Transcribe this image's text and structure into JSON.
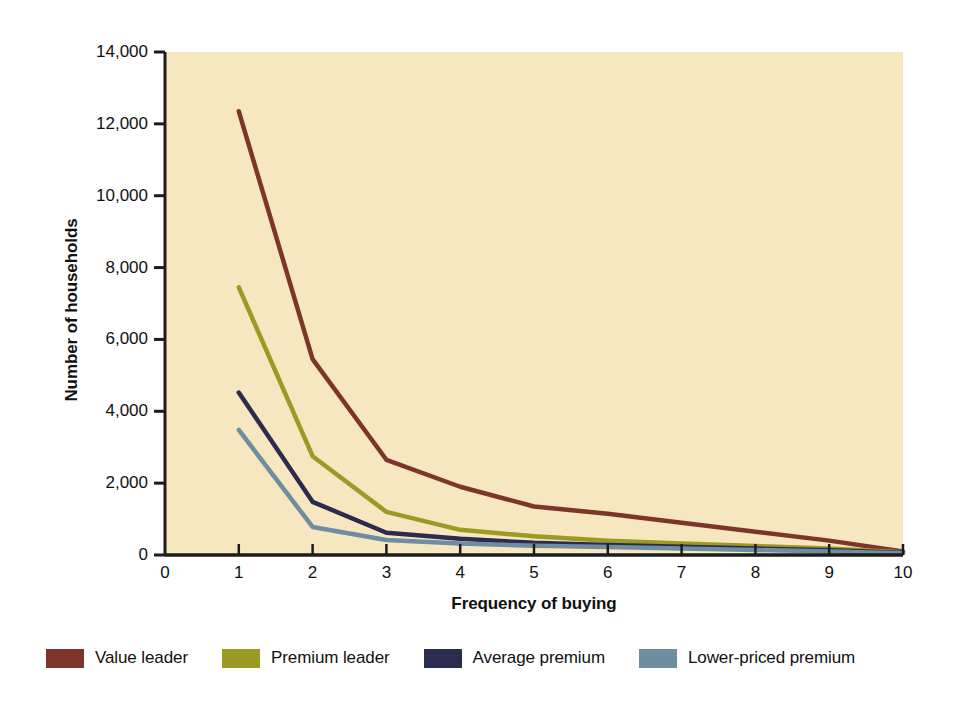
{
  "chart_data": {
    "type": "line",
    "title": "",
    "xlabel": "Frequency of buying",
    "ylabel": "Number of households",
    "x": [
      1,
      2,
      3,
      4,
      5,
      6,
      7,
      8,
      9,
      10
    ],
    "xlim": [
      0,
      10
    ],
    "ylim": [
      0,
      14000
    ],
    "xticks": [
      "0",
      "1",
      "2",
      "3",
      "4",
      "5",
      "6",
      "7",
      "8",
      "9",
      "10"
    ],
    "yticks": [
      "0",
      "2,000",
      "4,000",
      "6,000",
      "8,000",
      "10,000",
      "12,000",
      "14,000"
    ],
    "grid": false,
    "legend_position": "bottom",
    "plot_background": "#f7e7c0",
    "series": [
      {
        "name": "Value leader",
        "color": "#7c3528",
        "values": [
          12350,
          5450,
          2650,
          1900,
          1350,
          1150,
          900,
          650,
          400,
          100
        ]
      },
      {
        "name": "Premium leader",
        "color": "#9a9a25",
        "values": [
          7450,
          2750,
          1200,
          700,
          520,
          400,
          320,
          250,
          180,
          80
        ]
      },
      {
        "name": "Average premium",
        "color": "#2b2b4f",
        "values": [
          4520,
          1480,
          620,
          450,
          340,
          280,
          230,
          180,
          130,
          60
        ]
      },
      {
        "name": "Lower-priced premium",
        "color": "#6e8da0",
        "values": [
          3480,
          780,
          420,
          320,
          260,
          220,
          180,
          140,
          100,
          50
        ]
      }
    ]
  },
  "legend": {
    "items": [
      {
        "label": "Value leader",
        "color": "#7c3528"
      },
      {
        "label": "Premium leader",
        "color": "#9a9a25"
      },
      {
        "label": "Average premium",
        "color": "#2b2b4f"
      },
      {
        "label": "Lower-priced premium",
        "color": "#6e8da0"
      }
    ]
  }
}
